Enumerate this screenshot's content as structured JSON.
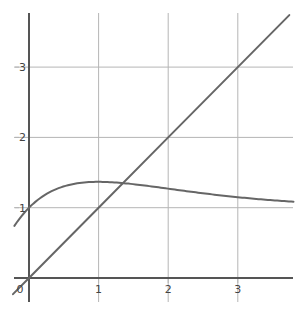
{
  "chart_data": {
    "type": "line",
    "title": "",
    "xlabel": "",
    "ylabel": "",
    "xlim": [
      -0.23,
      3.8
    ],
    "ylim": [
      -0.35,
      3.8
    ],
    "grid": true,
    "legend": null,
    "x_ticks": [
      {
        "value": 0,
        "label": "0"
      },
      {
        "value": 1,
        "label": "1"
      },
      {
        "value": 2,
        "label": "2"
      },
      {
        "value": 3,
        "label": "3"
      }
    ],
    "y_ticks": [
      {
        "value": 1,
        "label": "1"
      },
      {
        "value": 2,
        "label": "2"
      },
      {
        "value": 3,
        "label": "3"
      }
    ],
    "series": [
      {
        "name": "line y = x",
        "color": "#666666",
        "x": [
          -0.23,
          0,
          1,
          2,
          3,
          3.74
        ],
        "y": [
          -0.23,
          0,
          1,
          2,
          3,
          3.74
        ]
      },
      {
        "name": "curve",
        "color": "#666666",
        "x": [
          -0.21,
          0,
          0.25,
          0.5,
          0.75,
          1,
          1.5,
          2,
          2.5,
          3,
          3.5,
          3.8
        ],
        "y": [
          0.74,
          1.0,
          1.19,
          1.3,
          1.35,
          1.37,
          1.33,
          1.27,
          1.21,
          1.15,
          1.11,
          1.09
        ]
      }
    ]
  },
  "colors": {
    "axis": "#555555",
    "grid": "#b5b5b5",
    "curve": "#666666",
    "label": "#444444"
  }
}
